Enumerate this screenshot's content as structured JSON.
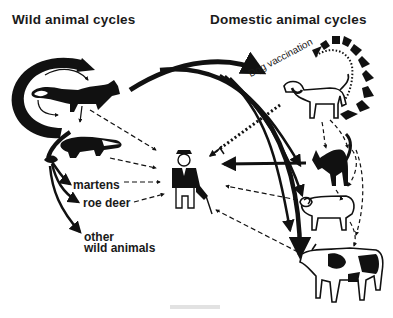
{
  "headings": {
    "wild": "Wild animal cycles",
    "domestic": "Domestic animal cycles"
  },
  "labels": {
    "martens": "martens",
    "roe_deer": "roe deer",
    "other_line1": "other",
    "other_line2": "wild animals",
    "dog_vaccination": "Dog vaccination"
  },
  "wild_animals": [
    "fox",
    "badger",
    "martens",
    "roe deer",
    "other wild animals"
  ],
  "domestic_animals": [
    "dog",
    "cat",
    "sheep",
    "cow"
  ],
  "center": "human",
  "colors": {
    "ink": "#111111",
    "background": "#ffffff"
  }
}
